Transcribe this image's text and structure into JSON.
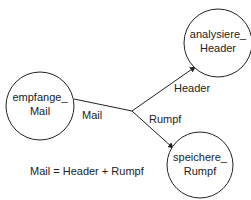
{
  "nodes": [
    {
      "id": "empfange",
      "line1": "empfange_",
      "line2": "Mail",
      "cx": 40,
      "cy": 106,
      "r": 34
    },
    {
      "id": "analysiere",
      "line1": "analysiere_",
      "line2": "Header",
      "cx": 218,
      "cy": 43,
      "r": 34
    },
    {
      "id": "speichere",
      "line1": "speichere_",
      "line2": "Rumpf",
      "cx": 200,
      "cy": 165,
      "r": 33
    }
  ],
  "edges": [
    {
      "label": "Mail"
    },
    {
      "label": "Header"
    },
    {
      "label": "Rumpf"
    }
  ],
  "annotation": "Mail = Header + Rumpf",
  "colors": {
    "stroke": "#222222",
    "background": "#ffffff"
  }
}
